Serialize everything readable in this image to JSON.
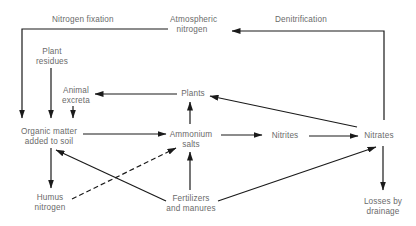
{
  "diagram": {
    "type": "flow",
    "nodes": {
      "atmospheric_nitrogen": {
        "line1": "Atmospheric",
        "line2": "nitrogen"
      },
      "plant_residues": {
        "line1": "Plant",
        "line2": "residues"
      },
      "animal_excreta": {
        "line1": "Animal",
        "line2": "excreta"
      },
      "plants": {
        "line1": "Plants"
      },
      "organic_matter": {
        "line1": "Organic matter",
        "line2": "added to soil"
      },
      "ammonium_salts": {
        "line1": "Ammonium",
        "line2": "salts"
      },
      "nitrites": {
        "line1": "Nitrites"
      },
      "nitrates": {
        "line1": "Nitrates"
      },
      "humus_nitrogen": {
        "line1": "Humus",
        "line2": "nitrogen"
      },
      "fertilizers": {
        "line1": "Fertilizers",
        "line2": "and manures"
      },
      "losses": {
        "line1": "Losses by",
        "line2": "drainage"
      }
    },
    "edge_labels": {
      "nitrogen_fixation": "Nitrogen fixation",
      "denitrification": "Denitrification"
    },
    "edges": [
      {
        "from": "Atmospheric nitrogen",
        "to": "Organic matter added to soil",
        "label": "Nitrogen fixation",
        "style": "solid"
      },
      {
        "from": "Nitrates",
        "to": "Atmospheric nitrogen",
        "label": "Denitrification",
        "style": "solid"
      },
      {
        "from": "Plant residues",
        "to": "Organic matter added to soil",
        "style": "solid"
      },
      {
        "from": "Animal excreta",
        "to": "Organic matter added to soil",
        "style": "solid"
      },
      {
        "from": "Plants",
        "to": "Animal excreta",
        "style": "solid"
      },
      {
        "from": "Nitrates",
        "to": "Plants",
        "style": "solid"
      },
      {
        "from": "Ammonium salts",
        "to": "Plants",
        "style": "solid"
      },
      {
        "from": "Organic matter added to soil",
        "to": "Ammonium salts",
        "style": "solid"
      },
      {
        "from": "Ammonium salts",
        "to": "Nitrites",
        "style": "solid"
      },
      {
        "from": "Nitrites",
        "to": "Nitrates",
        "style": "solid"
      },
      {
        "from": "Nitrates",
        "to": "Losses by drainage",
        "style": "solid"
      },
      {
        "from": "Organic matter added to soil",
        "to": "Humus nitrogen",
        "style": "solid"
      },
      {
        "from": "Humus nitrogen",
        "to": "Ammonium salts",
        "style": "dashed"
      },
      {
        "from": "Fertilizers and manures",
        "to": "Organic matter added to soil",
        "style": "solid"
      },
      {
        "from": "Fertilizers and manures",
        "to": "Ammonium salts",
        "style": "solid"
      },
      {
        "from": "Fertilizers and manures",
        "to": "Nitrates",
        "style": "solid"
      }
    ],
    "colors": {
      "line": "#1a1a1a",
      "text": "#6a6a6a",
      "background": "#ffffff"
    }
  }
}
